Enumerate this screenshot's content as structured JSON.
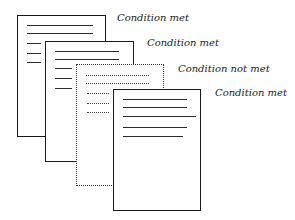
{
  "diagram": {
    "pages": [
      {
        "id": "page-1",
        "style": "solid",
        "label": "Condition met",
        "box": {
          "x": 17,
          "y": 15,
          "w": 89,
          "h": 122
        },
        "label_pos": {
          "x": 117,
          "y": 13
        },
        "lines": [
          {
            "x": 27,
            "y": 25,
            "w": 66
          },
          {
            "x": 27,
            "y": 33,
            "w": 66
          },
          {
            "x": 27,
            "y": 43,
            "w": 14
          },
          {
            "x": 27,
            "y": 53,
            "w": 14
          },
          {
            "x": 27,
            "y": 62,
            "w": 14
          }
        ]
      },
      {
        "id": "page-2",
        "style": "solid",
        "label": "Condition met",
        "box": {
          "x": 45,
          "y": 41,
          "w": 89,
          "h": 121
        },
        "label_pos": {
          "x": 147,
          "y": 38
        },
        "lines": [
          {
            "x": 55,
            "y": 51,
            "w": 64
          },
          {
            "x": 55,
            "y": 59,
            "w": 64
          },
          {
            "x": 55,
            "y": 68,
            "w": 17
          },
          {
            "x": 55,
            "y": 78,
            "w": 17
          },
          {
            "x": 55,
            "y": 88,
            "w": 17
          }
        ]
      },
      {
        "id": "page-3",
        "style": "dotted",
        "label": "Condition not met",
        "box": {
          "x": 76,
          "y": 64,
          "w": 88,
          "h": 122
        },
        "label_pos": {
          "x": 178,
          "y": 64
        },
        "lines": [
          {
            "x": 86,
            "y": 75,
            "w": 63
          },
          {
            "x": 86,
            "y": 83,
            "w": 63
          },
          {
            "x": 87,
            "y": 93,
            "w": 22
          },
          {
            "x": 87,
            "y": 103,
            "w": 22
          },
          {
            "x": 87,
            "y": 112,
            "w": 22
          }
        ]
      },
      {
        "id": "page-4",
        "style": "solid",
        "label": "Condition met",
        "box": {
          "x": 113,
          "y": 89,
          "w": 88,
          "h": 122
        },
        "label_pos": {
          "x": 215,
          "y": 88
        },
        "lines": [
          {
            "x": 123,
            "y": 99,
            "w": 64
          },
          {
            "x": 123,
            "y": 107,
            "w": 64
          },
          {
            "x": 123,
            "y": 116,
            "w": 73
          },
          {
            "x": 123,
            "y": 127,
            "w": 64
          },
          {
            "x": 123,
            "y": 136,
            "w": 60
          }
        ]
      }
    ]
  }
}
